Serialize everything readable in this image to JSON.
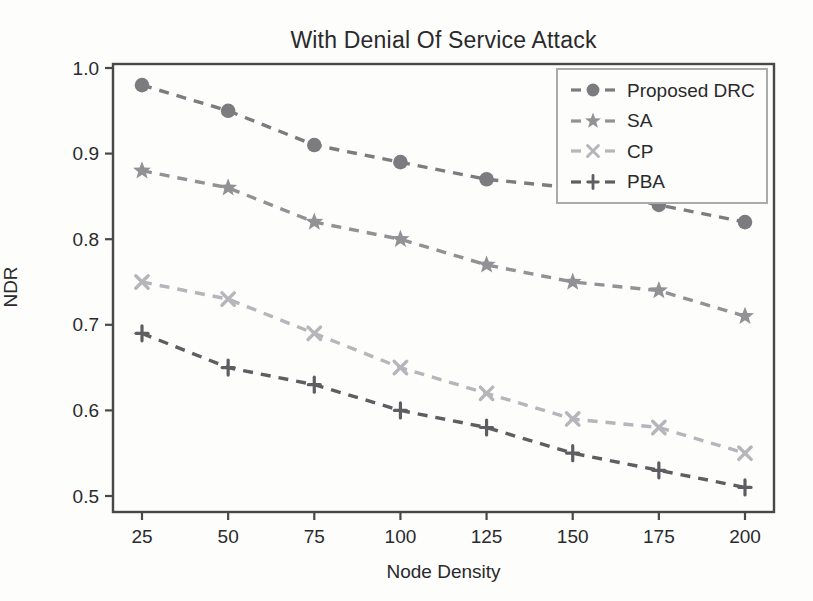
{
  "chart_data": {
    "type": "line",
    "title": "With Denial Of Service Attack",
    "xlabel": "Node Density",
    "ylabel": "NDR",
    "x": [
      25,
      50,
      75,
      100,
      125,
      150,
      175,
      200
    ],
    "x_tick_labels": [
      "25",
      "50",
      "75",
      "100",
      "125",
      "150",
      "175",
      "200"
    ],
    "y_ticks": [
      0.5,
      0.6,
      0.7,
      0.8,
      0.9,
      1.0
    ],
    "y_tick_labels": [
      "0.5",
      "0.6",
      "0.7",
      "0.8",
      "0.9",
      "1.0"
    ],
    "xlim": [
      22.5,
      207.5
    ],
    "ylim": [
      0.479,
      1.005
    ],
    "grid": false,
    "line_style": "dashed",
    "legend_position": "upper right",
    "axis_color": "#48484b",
    "text_color": "#2a2a2d",
    "legend_border_color": "#ababab",
    "series": [
      {
        "name": "Proposed DRC",
        "marker": "circle-icon",
        "color": "#7b7b80",
        "values": [
          0.98,
          0.95,
          0.91,
          0.89,
          0.87,
          0.86,
          0.84,
          0.82
        ]
      },
      {
        "name": "SA",
        "marker": "star-icon",
        "color": "#919196",
        "values": [
          0.88,
          0.86,
          0.82,
          0.8,
          0.77,
          0.75,
          0.74,
          0.71
        ]
      },
      {
        "name": "CP",
        "marker": "x-icon",
        "color": "#b5b5bb",
        "values": [
          0.75,
          0.73,
          0.69,
          0.65,
          0.62,
          0.59,
          0.58,
          0.55
        ]
      },
      {
        "name": "PBA",
        "marker": "plus-icon",
        "color": "#5e5e62",
        "values": [
          0.69,
          0.65,
          0.63,
          0.6,
          0.58,
          0.55,
          0.53,
          0.51
        ]
      }
    ]
  }
}
